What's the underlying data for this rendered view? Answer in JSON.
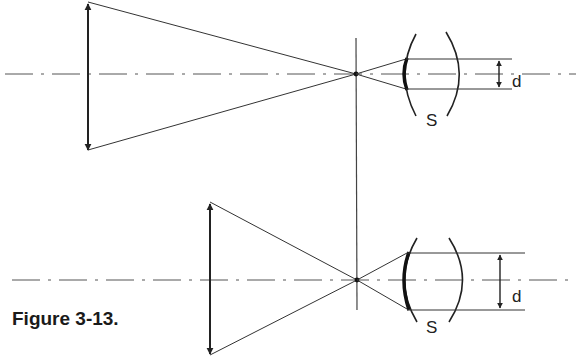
{
  "figure": {
    "caption": "Figure 3-13.",
    "colors": {
      "line": "#222222",
      "background": "#ffffff"
    }
  },
  "diagrams": [
    {
      "id": "top",
      "labels": {
        "surface": "S",
        "dimension": "d"
      },
      "axis_y": 74,
      "lens": {
        "x": 88,
        "y_top": 2,
        "y_bottom": 150
      },
      "focal_point": {
        "x": 356,
        "y": 74
      },
      "beam_top_y": 59,
      "beam_bottom_y": 89
    },
    {
      "id": "bottom",
      "labels": {
        "surface": "S",
        "dimension": "d"
      },
      "axis_y": 280,
      "lens": {
        "x": 210,
        "y_top": 202,
        "y_bottom": 355
      },
      "focal_point": {
        "x": 357,
        "y": 280
      },
      "beam_top_y": 253,
      "beam_bottom_y": 310
    }
  ]
}
